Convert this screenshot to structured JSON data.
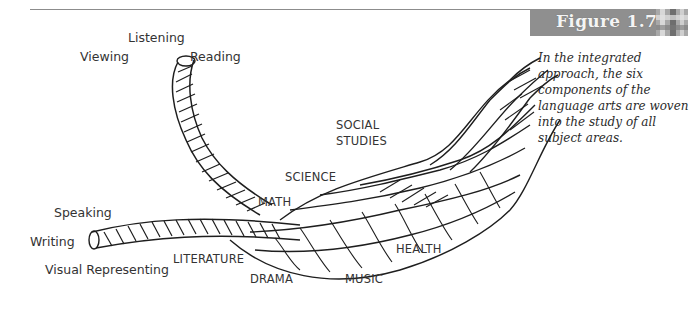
{
  "figure": {
    "title": "Figure 1.7",
    "caption": "In the integrated approach, the six components of the language arts are woven into the study of all subject areas.",
    "header_color": "#8f8f8f"
  },
  "language_arts": {
    "listening": "Listening",
    "viewing": "Viewing",
    "reading": "Reading",
    "speaking": "Speaking",
    "writing": "Writing",
    "visual_representing": "Visual Representing"
  },
  "subject_areas": {
    "social_studies_1": "SOCIAL",
    "social_studies_2": "STUDIES",
    "science": "SCIENCE",
    "math": "MATH",
    "literature": "LITERATURE",
    "drama": "DRAMA",
    "music": "MUSIC",
    "health": "HEALTH"
  }
}
